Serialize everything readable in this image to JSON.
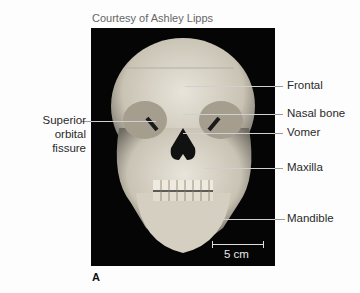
{
  "figure": {
    "credit": "Courtesy of Ashley Lipps",
    "panel_letter": "A",
    "scale_bar": "5 cm",
    "labels_right": [
      {
        "text": "Frontal"
      },
      {
        "text": "Nasal bone"
      },
      {
        "text": "Vomer"
      },
      {
        "text": "Maxilla"
      },
      {
        "text": "Mandible"
      }
    ],
    "label_left": "Superior orbital fissure",
    "label_left_lines": [
      "Superior",
      "orbital",
      "fissure"
    ]
  }
}
